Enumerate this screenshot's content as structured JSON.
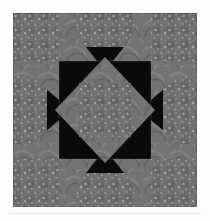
{
  "page": {
    "background_color": "#fdfdfd",
    "separator_color": "#e2e2e2",
    "caption_text": ""
  },
  "quilt": {
    "title": "Quilt Block",
    "alt_text": "Gray and black pieced quilt block, Ohio Star variation",
    "frame": {
      "x": 13,
      "y": 13,
      "width": 184,
      "height": 194
    },
    "grid": {
      "columns": 4,
      "rows": 4,
      "cell_width": 46,
      "cell_height": 48.5
    },
    "fabrics": [
      {
        "name": "background-black",
        "label": "Solid Black",
        "color": "#0a0a0a"
      },
      {
        "name": "speckled-gray",
        "label": "Speckled Gray Print",
        "color": "#6e6e6e"
      },
      {
        "name": "swirl-gray",
        "label": "Swirl Gray Print",
        "color": "#737373"
      }
    ],
    "texture": {
      "speckle_dot_color": "#a9a9a9",
      "speckle_dark_color": "#5a5a5a",
      "swirl_light_color": "#858585",
      "swirl_dark_color": "#5f5f5f",
      "seam_line_color": "#8d8d8d"
    },
    "patch_count": 28,
    "pattern_name": "Ohio Star Variation"
  }
}
